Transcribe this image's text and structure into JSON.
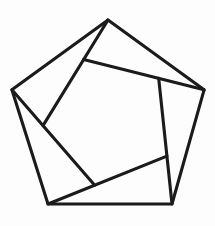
{
  "figure": {
    "type": "geometric-line-drawing",
    "canvas": {
      "width": 215,
      "height": 226
    },
    "background_color": "#fdfdfd",
    "stroke_color": "#1b1b1b",
    "stroke_width": 3.1,
    "outer_pentagon": {
      "name": "outer-pentagon",
      "vertices": [
        [
          108.0,
          20.0
        ],
        [
          204.1,
          89.8
        ],
        [
          172.0,
          204.0
        ],
        [
          48.0,
          204.0
        ],
        [
          11.9,
          89.8
        ]
      ]
    },
    "inner_pentagon": {
      "name": "inner-pentagon",
      "vertices": [
        [
          43.0,
          125.6
        ],
        [
          83.6,
          59.6
        ],
        [
          158.7,
          78.4
        ],
        [
          166.9,
          156.1
        ],
        [
          94.7,
          185.2
        ]
      ]
    },
    "chords": [
      {
        "name": "chord-from-top-vertex",
        "from": [
          108.0,
          20.0
        ],
        "to": [
          43.0,
          125.6
        ]
      },
      {
        "name": "chord-from-right-vertex",
        "from": [
          204.1,
          89.8
        ],
        "to": [
          83.6,
          59.6
        ]
      },
      {
        "name": "chord-from-bottom-right-vertex",
        "from": [
          172.0,
          204.0
        ],
        "to": [
          158.7,
          78.4
        ]
      },
      {
        "name": "chord-from-bottom-left-vertex",
        "from": [
          48.0,
          204.0
        ],
        "to": [
          166.9,
          156.1
        ]
      },
      {
        "name": "chord-from-left-vertex",
        "from": [
          11.9,
          89.8
        ],
        "to": [
          94.7,
          185.2
        ]
      }
    ]
  }
}
